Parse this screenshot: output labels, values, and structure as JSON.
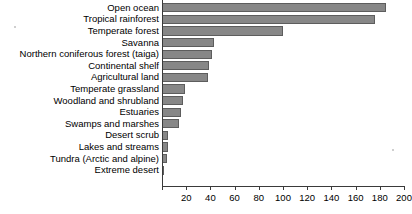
{
  "chart_data": {
    "type": "bar",
    "orientation": "horizontal",
    "title": "",
    "subtitle": "",
    "xlabel": "",
    "ylabel": "",
    "xlim": [
      0,
      200
    ],
    "grid": false,
    "legend": null,
    "bar_color": "#878787",
    "bar_border_color": "#5d5d5d",
    "axis_color": "#3a3a3a",
    "xticks": [
      0,
      20,
      40,
      60,
      80,
      100,
      120,
      140,
      160,
      180,
      200
    ],
    "xtick_labels": [
      "",
      "20",
      "40",
      "60",
      "80",
      "100",
      "120",
      "140",
      "160",
      "180",
      "200"
    ],
    "categories": [
      "Open ocean",
      "Tropical rainforest",
      "Temperate forest",
      "Savanna",
      "Northern coniferous forest (taiga)",
      "Continental shelf",
      "Agricultural land",
      "Temperate grassland",
      "Woodland and shrubland",
      "Estuaries",
      "Swamps and marshes",
      "Desert scrub",
      "Lakes and streams",
      "Tundra (Arctic and alpine)",
      "Extreme desert"
    ],
    "values": [
      185,
      176,
      100,
      43,
      41,
      39,
      38,
      19,
      17,
      16,
      14,
      5,
      5,
      4,
      1
    ]
  }
}
